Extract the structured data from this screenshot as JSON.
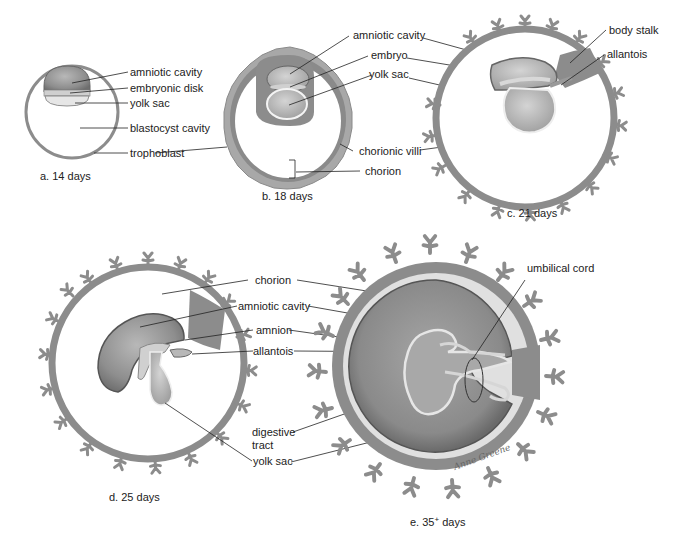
{
  "colors": {
    "wall": "#8c8c8c",
    "wall_light": "#a8a8a8",
    "cavity_dark": "#7a7a7a",
    "cavity_mid": "#9a9a9a",
    "cavity_light": "#bdbdbd",
    "pale": "#dedede",
    "text": "#222222"
  },
  "panels": {
    "a": {
      "caption": "a.  14 days",
      "labels": [
        "amniotic cavity",
        "embryonic disk",
        "yolk sac",
        "blastocyst cavity",
        "trophoblast"
      ]
    },
    "b": {
      "caption": "b.  18 days",
      "labels": [
        "amniotic cavity",
        "embryo",
        "yolk sac",
        "chorionic villi",
        "chorion"
      ]
    },
    "c": {
      "caption": "c.  21 days",
      "labels": [
        "body stalk",
        "allantois"
      ]
    },
    "d": {
      "caption": "d.  25 days",
      "labels": [
        "chorion",
        "amniotic cavity",
        "amnion",
        "allantois",
        "digestive",
        "tract",
        "yolk sac"
      ]
    },
    "e": {
      "caption_prefix": "e. 35",
      "caption_sup": "+",
      "caption_suffix": " days",
      "labels": [
        "umbilical cord"
      ],
      "signature": "Anne Greene"
    }
  }
}
